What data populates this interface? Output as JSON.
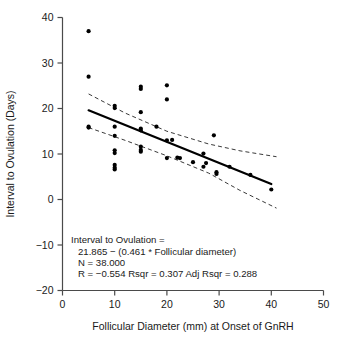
{
  "chart_data": {
    "type": "scatter",
    "title": "",
    "xlabel": "Follicular Diameter (mm) at Onset of GnRH",
    "ylabel": "Interval to Ovulation (Days)",
    "xlim": [
      0,
      50
    ],
    "ylim": [
      -20,
      40
    ],
    "xticks": [
      0,
      10,
      20,
      30,
      40,
      50
    ],
    "yticks": [
      -20,
      -10,
      0,
      10,
      20,
      30,
      40
    ],
    "xtick_labels": [
      "0",
      "10",
      "20",
      "30",
      "40",
      "50"
    ],
    "ytick_labels": [
      "-20",
      "-10",
      "0",
      "10",
      "20",
      "30",
      "40"
    ],
    "grid": false,
    "legend": false,
    "points": [
      {
        "x": 5,
        "y": 37
      },
      {
        "x": 5,
        "y": 27
      },
      {
        "x": 5,
        "y": 16
      },
      {
        "x": 5,
        "y": 15.8
      },
      {
        "x": 10,
        "y": 20.6
      },
      {
        "x": 10,
        "y": 20.1
      },
      {
        "x": 10,
        "y": 16
      },
      {
        "x": 10,
        "y": 14
      },
      {
        "x": 10,
        "y": 10.8
      },
      {
        "x": 10,
        "y": 10.2
      },
      {
        "x": 10,
        "y": 7.6
      },
      {
        "x": 10,
        "y": 7.0
      },
      {
        "x": 10,
        "y": 6.6
      },
      {
        "x": 15,
        "y": 24.8
      },
      {
        "x": 15,
        "y": 24.3
      },
      {
        "x": 15,
        "y": 19.2
      },
      {
        "x": 15,
        "y": 15.6
      },
      {
        "x": 15,
        "y": 15.2
      },
      {
        "x": 15,
        "y": 11.6
      },
      {
        "x": 15,
        "y": 10.9
      },
      {
        "x": 15,
        "y": 10.5
      },
      {
        "x": 18,
        "y": 16
      },
      {
        "x": 20,
        "y": 25.1
      },
      {
        "x": 20,
        "y": 22
      },
      {
        "x": 20,
        "y": 13
      },
      {
        "x": 20,
        "y": 9.1
      },
      {
        "x": 21,
        "y": 13.1
      },
      {
        "x": 22,
        "y": 9.2
      },
      {
        "x": 22.5,
        "y": 9.1
      },
      {
        "x": 25,
        "y": 8.2
      },
      {
        "x": 27,
        "y": 10.1
      },
      {
        "x": 27,
        "y": 7.2
      },
      {
        "x": 27.5,
        "y": 8.0
      },
      {
        "x": 29,
        "y": 14.1
      },
      {
        "x": 29.5,
        "y": 6.0
      },
      {
        "x": 29.5,
        "y": 5.6
      },
      {
        "x": 32,
        "y": 7.2
      },
      {
        "x": 36,
        "y": 5.4
      },
      {
        "x": 40,
        "y": 2.2
      }
    ],
    "regression": {
      "intercept": 21.865,
      "slope": -0.461,
      "x_start": 5,
      "x_end": 40,
      "y_start": 19.6,
      "y_end": 3.4
    },
    "confidence_band_upper": [
      {
        "x": 5,
        "y": 23.2
      },
      {
        "x": 12,
        "y": 19.0
      },
      {
        "x": 20,
        "y": 15.0
      },
      {
        "x": 28,
        "y": 12.2
      },
      {
        "x": 34,
        "y": 10.7
      },
      {
        "x": 41,
        "y": 9.4
      }
    ],
    "confidence_band_lower": [
      {
        "x": 5,
        "y": 15.8
      },
      {
        "x": 12,
        "y": 13.0
      },
      {
        "x": 20,
        "y": 9.6
      },
      {
        "x": 28,
        "y": 5.8
      },
      {
        "x": 34,
        "y": 2.0
      },
      {
        "x": 41,
        "y": -1.9
      }
    ],
    "annotation": {
      "line1": "Interval to Ovulation =",
      "line2": "21.865 − (0.461 * Follicular diameter)",
      "line3": "N = 38.000",
      "line4": "R = −0.554 Rsqr = 0.307 Adj Rsqr = 0.288"
    },
    "statistics": {
      "n": 38.0,
      "r": -0.554,
      "rsqr": 0.307,
      "adj_rsqr": 0.288
    },
    "colors": {
      "point": "#000000",
      "fit_line": "#000000",
      "confidence_line": "#3a3a3a",
      "axis": "#4a4a4a",
      "text": "#1a1a1a",
      "background": "#ffffff"
    }
  }
}
